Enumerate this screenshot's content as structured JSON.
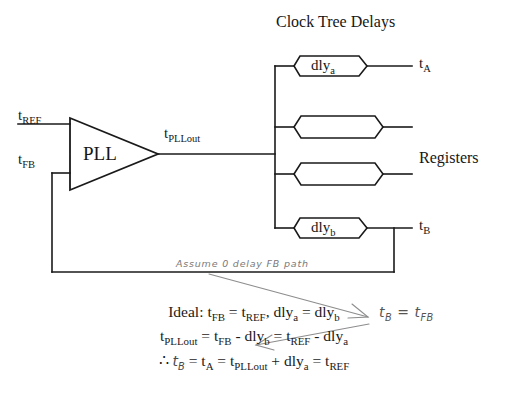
{
  "figure": {
    "title": "Clock Tree Delays",
    "registers_label": "Registers"
  },
  "signals": {
    "tref": {
      "base": "t",
      "sub": "REF"
    },
    "tfb": {
      "base": "t",
      "sub": "FB"
    },
    "tpllout": {
      "base": "t",
      "sub": "PLLout"
    },
    "ta": {
      "base": "t",
      "sub": "A"
    },
    "tb": {
      "base": "t",
      "sub": "B"
    }
  },
  "blocks": {
    "pll": {
      "label": "PLL"
    },
    "dly_a": {
      "base": "dly",
      "sub": "a"
    },
    "dly_b": {
      "base": "dly",
      "sub": "b"
    },
    "unlabeled_count": 2
  },
  "annotations": {
    "assume_note": "Assume 0 delay FB path",
    "hand_equation": {
      "lhs_base": "t",
      "lhs_sub": "B",
      "op": "=",
      "rhs_base": "t",
      "rhs_sub": "FB"
    }
  },
  "equations": {
    "line1": {
      "prefix": "Ideal: ",
      "terms": [
        {
          "base": "t",
          "sub": "FB"
        },
        {
          "op": " = "
        },
        {
          "base": "t",
          "sub": "REF"
        },
        {
          "op": ",  "
        },
        {
          "base": "dly",
          "sub": "a"
        },
        {
          "op": " = "
        },
        {
          "base": "dly",
          "sub": "b"
        }
      ]
    },
    "line2": {
      "terms": [
        {
          "base": "t",
          "sub": "PLLout"
        },
        {
          "op": " = "
        },
        {
          "base": "t",
          "sub": "FB"
        },
        {
          "op": " - "
        },
        {
          "base": "dly",
          "sub": "b"
        },
        {
          "op": " = "
        },
        {
          "base": "t",
          "sub": "REF"
        },
        {
          "op": " - "
        },
        {
          "base": "dly",
          "sub": "a"
        }
      ]
    },
    "line3": {
      "prefix": "∴ ",
      "terms": [
        {
          "base": "t",
          "sub": "B",
          "hand": true
        },
        {
          "op": " = "
        },
        {
          "base": "t",
          "sub": "A"
        },
        {
          "op": " = "
        },
        {
          "base": "t",
          "sub": "PLLout"
        },
        {
          "op": " + "
        },
        {
          "base": "dly",
          "sub": "a"
        },
        {
          "op": " = "
        },
        {
          "base": "t",
          "sub": "REF"
        }
      ]
    }
  },
  "colors": {
    "background": "#ffffff",
    "line": "#1a1a1a",
    "text": "#161616",
    "handwriting": "#6b6b6b"
  }
}
